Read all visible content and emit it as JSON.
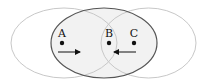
{
  "diagram": {
    "type": "overlapping-ellipses",
    "colors": {
      "background": "#ffffff",
      "middle_fill": "#f2f2f2",
      "middle_stroke": "#555555",
      "side_stroke": "#c8c8c8",
      "ink": "#111111"
    },
    "ellipses": [
      {
        "name": "left",
        "cx": 64,
        "cy": 43,
        "rx": 53,
        "ry": 35
      },
      {
        "name": "middle",
        "cx": 104,
        "cy": 43,
        "rx": 53,
        "ry": 35
      },
      {
        "name": "right",
        "cx": 148.5,
        "cy": 43,
        "rx": 47.5,
        "ry": 35
      }
    ],
    "points": [
      {
        "label": "A",
        "x": 62,
        "y": 43
      },
      {
        "label": "B",
        "x": 109,
        "y": 43
      },
      {
        "label": "C",
        "x": 134,
        "y": 43
      }
    ],
    "arrows": [
      {
        "name": "arrow-from-a",
        "x1": 58,
        "y1": 52,
        "x2": 80,
        "y2": 52,
        "direction": "right"
      },
      {
        "name": "arrow-from-c",
        "x1": 136,
        "y1": 52,
        "x2": 114,
        "y2": 52,
        "direction": "left"
      }
    ]
  }
}
